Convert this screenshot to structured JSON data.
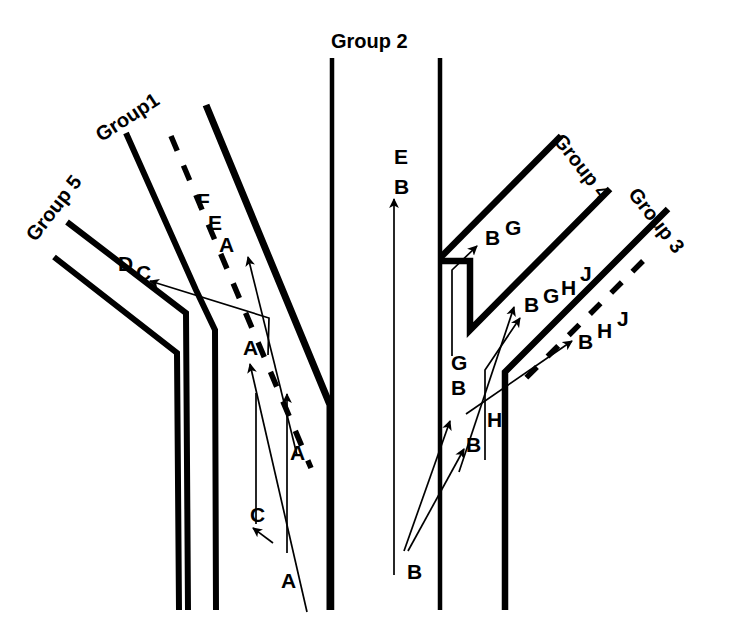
{
  "figure": {
    "kind": "junction-movement-diagram",
    "background_color": "#ffffff",
    "ink_color": "#000000",
    "width": 732,
    "height": 644
  },
  "group_labels": [
    {
      "id": "group1",
      "text": "Group1",
      "x": 92,
      "y": 128,
      "rotation": -33
    },
    {
      "id": "group2",
      "text": "Group 2",
      "x": 331,
      "y": 31,
      "rotation": 0
    },
    {
      "id": "group3",
      "text": "Group 3",
      "x": 641,
      "y": 184,
      "rotation": 52
    },
    {
      "id": "group4",
      "text": "Group 4",
      "x": 566,
      "y": 130,
      "rotation": 52
    },
    {
      "id": "group5",
      "text": "Group 5",
      "x": 22,
      "y": 232,
      "rotation": -52
    }
  ],
  "movement_labels": [
    {
      "id": "g1-F",
      "text": "F",
      "x": 197,
      "y": 190
    },
    {
      "id": "g1-E",
      "text": "E",
      "x": 208,
      "y": 212
    },
    {
      "id": "g1-A",
      "text": "A",
      "x": 219,
      "y": 234
    },
    {
      "id": "g5-D",
      "text": "D",
      "x": 118,
      "y": 253
    },
    {
      "id": "g5-C",
      "text": "C",
      "x": 136,
      "y": 262
    },
    {
      "id": "mid-A",
      "text": "A",
      "x": 243,
      "y": 337
    },
    {
      "id": "stem-A-up",
      "text": "A",
      "x": 290,
      "y": 442
    },
    {
      "id": "stem-C",
      "text": "C",
      "x": 250,
      "y": 504
    },
    {
      "id": "stem-A-in",
      "text": "A",
      "x": 281,
      "y": 570
    },
    {
      "id": "g2-E",
      "text": "E",
      "x": 394,
      "y": 146
    },
    {
      "id": "g2-B",
      "text": "B",
      "x": 394,
      "y": 176
    },
    {
      "id": "g4-B",
      "text": "B",
      "x": 485,
      "y": 227
    },
    {
      "id": "g4-G",
      "text": "G",
      "x": 505,
      "y": 217
    },
    {
      "id": "loop-B",
      "text": "B",
      "x": 524,
      "y": 294
    },
    {
      "id": "loop-G",
      "text": "G",
      "x": 543,
      "y": 285
    },
    {
      "id": "loop-H",
      "text": "H",
      "x": 561,
      "y": 277
    },
    {
      "id": "loop-J",
      "text": "J",
      "x": 580,
      "y": 263
    },
    {
      "id": "left-G",
      "text": "G",
      "x": 451,
      "y": 352
    },
    {
      "id": "left-B",
      "text": "B",
      "x": 451,
      "y": 377
    },
    {
      "id": "mid-H",
      "text": "H",
      "x": 487,
      "y": 409
    },
    {
      "id": "mid-B",
      "text": "B",
      "x": 466,
      "y": 434
    },
    {
      "id": "g3-B",
      "text": "B",
      "x": 578,
      "y": 331
    },
    {
      "id": "g3-H",
      "text": "H",
      "x": 597,
      "y": 320
    },
    {
      "id": "g3-J",
      "text": "J",
      "x": 617,
      "y": 308
    },
    {
      "id": "bot-B",
      "text": "B",
      "x": 407,
      "y": 561
    }
  ],
  "roads": {
    "group1": {
      "left_edge": "M 126,133 L 196,290 L 215,330 L 216,610",
      "right_edge": "M 206,105 L 330,405 L 330,610",
      "centre_dashed": "M 171,136 L 310,465"
    },
    "group2": {
      "left_edge": "M 332,58 L 332,610",
      "right_edge": "M 440,58 L 440,610"
    },
    "group5": {
      "upper_edge": "M 67,222 L 186,313 L 188,610",
      "lower_edge": "M 54,257 L 177,352 L 179,610"
    },
    "group4": {
      "outer_edge": "M 560,137 L 440,258",
      "inner_edge": "M 608,190 L 470,330 L 470,262 L 440,262",
      "loop_inner": "M 470,330 L 470,262",
      "loop_cap": "M 470,262 L 440,262"
    },
    "group3": {
      "upper_edge": "M 667,210 L 505,372 L 505,610",
      "centre_dashed": "M 640,264 L 520,384"
    }
  },
  "flow_arrows": [
    {
      "id": "arrow-g1-A",
      "from": [
        296,
        452
      ],
      "to": [
        247,
        254
      ]
    },
    {
      "id": "arrow-g1-mid",
      "from": [
        305,
        610
      ],
      "to": [
        249,
        361
      ]
    },
    {
      "id": "arrow-g5-DC",
      "from": [
        235,
        380
      ],
      "to": [
        148,
        280
      ]
    },
    {
      "id": "arrow-stem-A",
      "from": [
        287,
        550
      ],
      "to": [
        287,
        390
      ]
    },
    {
      "id": "arrow-stem-C",
      "from": [
        272,
        536
      ],
      "to": [
        250,
        528
      ]
    },
    {
      "id": "arrow-g2-EB",
      "from": [
        394,
        570
      ],
      "to": [
        394,
        196
      ]
    },
    {
      "id": "arrow-g4-BG",
      "from": [
        452,
        352
      ],
      "to": [
        475,
        243
      ]
    },
    {
      "id": "arrow-loop1",
      "from": [
        462,
        468
      ],
      "to": [
        512,
        304
      ]
    },
    {
      "id": "arrow-loop2",
      "from": [
        487,
        455
      ],
      "to": [
        518,
        315
      ]
    },
    {
      "id": "arrow-g3-BHJ",
      "from": [
        465,
        410
      ],
      "to": [
        570,
        338
      ]
    },
    {
      "id": "arrow-bot1",
      "from": [
        404,
        548
      ],
      "to": [
        449,
        418
      ]
    },
    {
      "id": "arrow-bot2",
      "from": [
        409,
        547
      ],
      "to": [
        462,
        446
      ]
    }
  ]
}
